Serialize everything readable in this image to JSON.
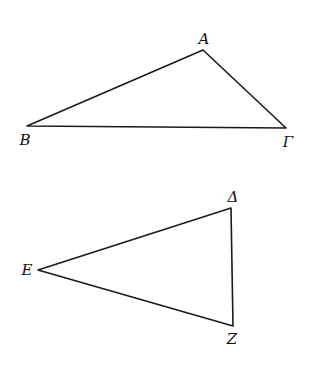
{
  "diagram": {
    "type": "geometry",
    "figures": [
      {
        "name": "triangle-ABG",
        "vertices": [
          {
            "label": "A",
            "x": 203,
            "y": 50,
            "lx": 204,
            "ly": 40
          },
          {
            "label": "B",
            "x": 27,
            "y": 126,
            "lx": 25,
            "ly": 141
          },
          {
            "label": "Γ",
            "x": 286,
            "y": 128,
            "lx": 288,
            "ly": 143
          }
        ]
      },
      {
        "name": "triangle-DEZ",
        "vertices": [
          {
            "label": "Δ",
            "x": 231,
            "y": 208,
            "lx": 233,
            "ly": 198
          },
          {
            "label": "E",
            "x": 38,
            "y": 270,
            "lx": 27,
            "ly": 271
          },
          {
            "label": "Z",
            "x": 233,
            "y": 326,
            "lx": 232,
            "ly": 340
          }
        ]
      }
    ],
    "colors": {
      "line": "#1a1a1a",
      "background": "#ffffff"
    }
  }
}
